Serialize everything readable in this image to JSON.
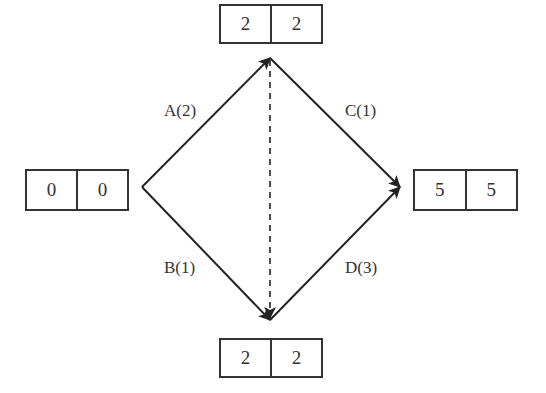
{
  "diagram": {
    "type": "activity-on-arrow network",
    "colors": {
      "line": "#222222",
      "box_border": "#333333",
      "text": "#333333",
      "background": "#ffffff"
    },
    "nodes": [
      {
        "id": "start",
        "position": "left",
        "cells": [
          "0",
          "0"
        ]
      },
      {
        "id": "upper",
        "position": "top",
        "cells": [
          "2",
          "2"
        ]
      },
      {
        "id": "lower",
        "position": "bottom",
        "cells": [
          "2",
          "2"
        ]
      },
      {
        "id": "end",
        "position": "right",
        "cells": [
          "5",
          "5"
        ]
      }
    ],
    "activities": [
      {
        "label": "A(2)",
        "from": "start",
        "to": "upper",
        "style": "solid"
      },
      {
        "label": "B(1)",
        "from": "start",
        "to": "lower",
        "style": "solid"
      },
      {
        "label": "C(1)",
        "from": "upper",
        "to": "end",
        "style": "solid"
      },
      {
        "label": "D(3)",
        "from": "lower",
        "to": "end",
        "style": "solid"
      },
      {
        "label": "",
        "from": "upper",
        "to": "lower",
        "style": "dashed",
        "note": "dummy activity"
      }
    ]
  }
}
